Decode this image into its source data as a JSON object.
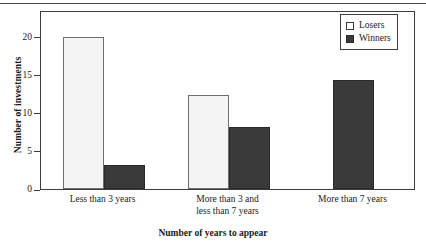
{
  "chart_data": {
    "type": "bar",
    "title": "",
    "xlabel": "Number of years to appear",
    "ylabel": "Number of investments",
    "categories": [
      "Less than 3 years",
      "More than 3 and\nless than 7 years",
      "More than 7 years"
    ],
    "series": [
      {
        "name": "Losers",
        "color": "#f4f4f4",
        "values": [
          20,
          12.3,
          0
        ]
      },
      {
        "name": "Winners",
        "color": "#3a3a3a",
        "values": [
          3.2,
          8.2,
          14.3
        ]
      }
    ],
    "ylim": [
      0,
      23.5
    ],
    "yticks": [
      0,
      5,
      10,
      15,
      20
    ],
    "ytick_labels": [
      "0",
      "5",
      "10",
      "15",
      "20"
    ],
    "grid": false,
    "legend_position": "top-right",
    "legend_entries": [
      "Losers",
      "Winners"
    ]
  }
}
